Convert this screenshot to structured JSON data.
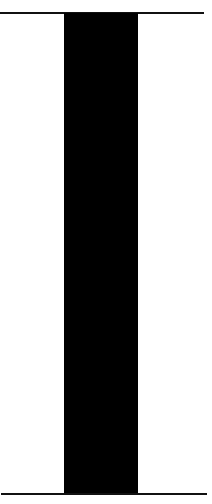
{
  "figure": {
    "colors": {
      "bar": "#000000",
      "lines": "#111111",
      "background": "#ffffff"
    },
    "bar": {
      "left": 64,
      "width": 74
    }
  }
}
